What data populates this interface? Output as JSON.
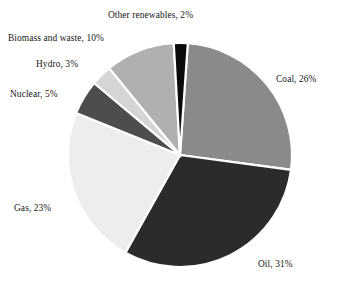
{
  "chart_data": {
    "type": "pie",
    "title": "",
    "subtitle": "",
    "xlabel": "",
    "ylabel": "",
    "legend_position": "none",
    "grid": false,
    "unit": "%",
    "categories": [
      "Coal",
      "Oil",
      "Gas",
      "Nuclear",
      "Hydro",
      "Biomass and waste",
      "Other renewables"
    ],
    "values": [
      26,
      31,
      23,
      5,
      3,
      10,
      2
    ],
    "total": 100,
    "start_angle_deg": -86,
    "direction": "clockwise",
    "slices": [
      {
        "name": "Coal",
        "value": 26,
        "label": "Coal, 26%",
        "color": "#8a8a8a",
        "start_deg": -86,
        "end_deg": 7.6
      },
      {
        "name": "Oil",
        "value": 31,
        "label": "Oil, 31%",
        "color": "#2b2b2b",
        "start_deg": 7.6,
        "end_deg": 119.2
      },
      {
        "name": "Gas",
        "value": 23,
        "label": "Gas, 23%",
        "color": "#ededed",
        "start_deg": 119.2,
        "end_deg": 202.0
      },
      {
        "name": "Nuclear",
        "value": 5,
        "label": "Nuclear, 5%",
        "color": "#4d4d4d",
        "start_deg": 202.0,
        "end_deg": 220.0
      },
      {
        "name": "Hydro",
        "value": 3,
        "label": "Hydro, 3%",
        "color": "#d5d5d5",
        "start_deg": 220.0,
        "end_deg": 230.8
      },
      {
        "name": "Biomass and waste",
        "value": 10,
        "label": "Biomass and waste, 10%",
        "color": "#b0b0b0",
        "start_deg": 230.8,
        "end_deg": 266.8
      },
      {
        "name": "Other renewables",
        "value": 2,
        "label": "Other renewables, 2%",
        "color": "#0a0a0a",
        "start_deg": 266.8,
        "end_deg": 274.0
      }
    ],
    "geometry": {
      "center_x": 180,
      "center_y": 155,
      "radius": 112,
      "separator_color": "#ffffff"
    }
  },
  "labels": {
    "coal": "Coal, 26%",
    "oil": "Oil, 31%",
    "gas": "Gas, 23%",
    "nuclear": "Nuclear, 5%",
    "hydro": "Hydro, 3%",
    "biomass": "Biomass and waste, 10%",
    "other_renewables": "Other renewables, 2%"
  }
}
